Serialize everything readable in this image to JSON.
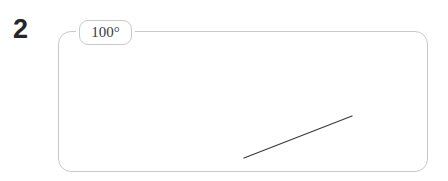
{
  "canvas": {
    "width": 448,
    "height": 181,
    "background_color": "#ffffff"
  },
  "item_number": {
    "label": "2",
    "color": "#262626"
  },
  "panel": {
    "name": "diagram-frame",
    "border_color": "#c9c9cb",
    "fill_color": "transparent",
    "corner_radius": 13,
    "x": 58,
    "y": 31,
    "width": 370,
    "height": 141
  },
  "angle_badge": {
    "value": "100°",
    "number": 100,
    "unit": "degrees",
    "border_color": "#c9c9cb",
    "background_color": "#ffffff",
    "text_color": "#3a3a3c"
  },
  "ray": {
    "name": "angle-ray",
    "stroke_color": "#3c3c3c",
    "stroke_width": 1.3,
    "x1": 244,
    "y1": 158,
    "x2": 352,
    "y2": 116
  }
}
